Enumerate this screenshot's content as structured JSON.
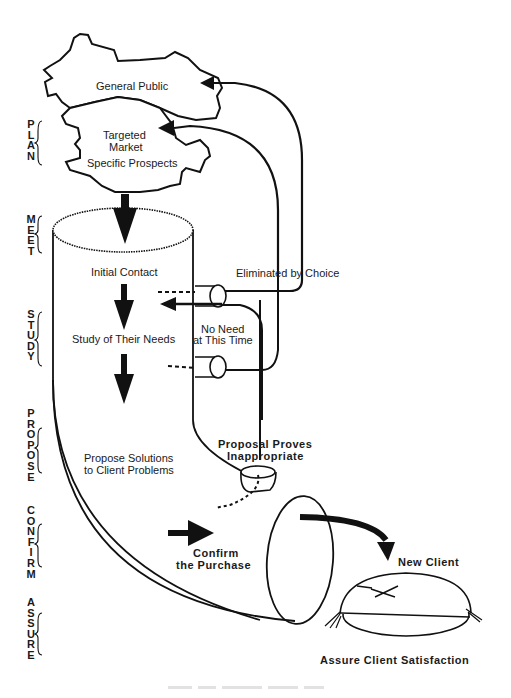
{
  "diagram": {
    "stages": [
      {
        "id": "plan",
        "letters": "P\nL\nA\nN",
        "top": 119
      },
      {
        "id": "meet",
        "letters": "M\nE\nE\nT",
        "top": 214
      },
      {
        "id": "study",
        "letters": "S\nT\nU\nD\nY",
        "top": 309
      },
      {
        "id": "propose",
        "letters": "P\nR\nO\nP\nO\nS\nE",
        "top": 408
      },
      {
        "id": "confirm",
        "letters": "C\nO\nN\nF\nI\nR\nM",
        "top": 505
      },
      {
        "id": "assure",
        "letters": "A\nS\nS\nU\nR\nE",
        "top": 597
      }
    ],
    "labels": {
      "general_public": "General Public",
      "targeted_market_1": "Targeted",
      "targeted_market_2": "Market",
      "specific_prospects": "Specific Prospects",
      "initial_contact": "Initial Contact",
      "eliminated_by_choice": "Eliminated by Choice",
      "no_need_1": "No Need",
      "no_need_2": "at This Time",
      "study_needs": "Study of Their Needs",
      "propose_solutions_1": "Propose Solutions",
      "propose_solutions_2": "to Client Problems",
      "proposal_inappropriate_1": "Proposal Proves",
      "proposal_inappropriate_2": "Inappropriate",
      "confirm_1": "Confirm",
      "confirm_2": "the Purchase",
      "new_client": "New Client",
      "assure_satisfaction": "Assure Client Satisfaction"
    },
    "caption": "illegible figure caption"
  }
}
